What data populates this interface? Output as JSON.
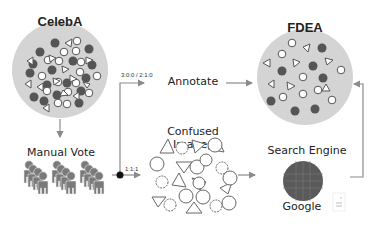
{
  "nodes": {
    "celeba": {
      "title": "CelebA"
    },
    "fdea": {
      "title": "FDEA"
    },
    "manual_vote": {
      "label": "Manual Vote"
    },
    "annotate": {
      "label": "Annotate"
    },
    "confused_images": {
      "label": "Confused Images"
    },
    "search_engine": {
      "label": "Search Engine",
      "sublabel": "Google"
    }
  },
  "edges": {
    "to_annotate": {
      "label": "3:0:0 / 2:1:0"
    },
    "to_confused": {
      "label": "1:1:1"
    }
  },
  "colors": {
    "circle_fill": "#d4d4d4",
    "box_fill": "#dcdcdc",
    "dark_dot": "#555555",
    "arrow": "#8a8a8a",
    "person": "#7a7a7a"
  }
}
